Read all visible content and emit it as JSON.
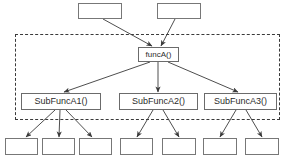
{
  "diagram": {
    "type": "call-graph",
    "canvas": {
      "width": 287,
      "height": 158
    },
    "colors": {
      "box_border": "#6b6b6b",
      "box_fill": "#ffffff",
      "text": "#2b2b2b",
      "edge": "#3a3a3a",
      "group_border": "#3a3a3a",
      "background": "#ffffff"
    },
    "group": {
      "name": "dashed-grouping-frame",
      "label": "",
      "style": "dashed",
      "x": 15,
      "y": 34,
      "width": 265,
      "height": 86
    },
    "callers": [
      {
        "id": "caller1",
        "label": "",
        "x": 78,
        "y": 3,
        "width": 44,
        "height": 16
      },
      {
        "id": "caller2",
        "label": "",
        "x": 157,
        "y": 3,
        "width": 44,
        "height": 16
      }
    ],
    "root": {
      "id": "funcA",
      "label": "funcA()",
      "x": 138,
      "y": 47,
      "width": 41,
      "height": 15
    },
    "subfunctions": [
      {
        "id": "subA1",
        "label": "SubFuncA1()",
        "x": 21,
        "y": 93,
        "width": 80,
        "height": 17
      },
      {
        "id": "subA2",
        "label": "SubFuncA2()",
        "x": 119,
        "y": 93,
        "width": 79,
        "height": 17
      },
      {
        "id": "subA3",
        "label": "SubFuncA3()",
        "x": 204,
        "y": 93,
        "width": 73,
        "height": 17
      }
    ],
    "leaves": [
      {
        "id": "leaf1",
        "label": "",
        "x": 5,
        "y": 138,
        "width": 33,
        "height": 17,
        "parent": "subA1"
      },
      {
        "id": "leaf2",
        "label": "",
        "x": 42,
        "y": 138,
        "width": 33,
        "height": 17,
        "parent": "subA1"
      },
      {
        "id": "leaf3",
        "label": "",
        "x": 79,
        "y": 138,
        "width": 33,
        "height": 17,
        "parent": "subA1"
      },
      {
        "id": "leaf4",
        "label": "",
        "x": 120,
        "y": 138,
        "width": 33,
        "height": 17,
        "parent": "subA2"
      },
      {
        "id": "leaf5",
        "label": "",
        "x": 162,
        "y": 138,
        "width": 34,
        "height": 17,
        "parent": "subA2"
      },
      {
        "id": "leaf6",
        "label": "",
        "x": 203,
        "y": 138,
        "width": 34,
        "height": 17,
        "parent": "subA3"
      },
      {
        "id": "leaf7",
        "label": "",
        "x": 245,
        "y": 138,
        "width": 34,
        "height": 17,
        "parent": "subA3"
      }
    ],
    "edges": [
      {
        "from": "caller1",
        "to": "funcA",
        "x1": 103,
        "y1": 19,
        "x2": 152,
        "y2": 46
      },
      {
        "from": "caller2",
        "to": "funcA",
        "x1": 175,
        "y1": 19,
        "x2": 161,
        "y2": 46
      },
      {
        "from": "funcA",
        "to": "subA1",
        "x1": 150,
        "y1": 62,
        "x2": 64,
        "y2": 92
      },
      {
        "from": "funcA",
        "to": "subA2",
        "x1": 158,
        "y1": 62,
        "x2": 158,
        "y2": 92
      },
      {
        "from": "funcA",
        "to": "subA3",
        "x1": 168,
        "y1": 62,
        "x2": 238,
        "y2": 92
      },
      {
        "from": "subA1",
        "to": "leaf1",
        "x1": 55,
        "y1": 110,
        "x2": 26,
        "y2": 137
      },
      {
        "from": "subA1",
        "to": "leaf2",
        "x1": 60,
        "y1": 110,
        "x2": 59,
        "y2": 137
      },
      {
        "from": "subA1",
        "to": "leaf3",
        "x1": 66,
        "y1": 110,
        "x2": 92,
        "y2": 137
      },
      {
        "from": "subA2",
        "to": "leaf4",
        "x1": 153,
        "y1": 110,
        "x2": 137,
        "y2": 137
      },
      {
        "from": "subA2",
        "to": "leaf5",
        "x1": 163,
        "y1": 110,
        "x2": 179,
        "y2": 137
      },
      {
        "from": "subA3",
        "to": "leaf6",
        "x1": 236,
        "y1": 110,
        "x2": 220,
        "y2": 137
      },
      {
        "from": "subA3",
        "to": "leaf7",
        "x1": 246,
        "y1": 110,
        "x2": 262,
        "y2": 137
      }
    ]
  }
}
